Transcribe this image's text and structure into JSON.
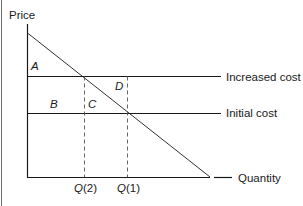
{
  "diagram": {
    "y_axis_label": "Price",
    "x_axis_label": "Quantity",
    "lines": {
      "increased_cost": "Increased cost",
      "initial_cost": "Initial cost"
    },
    "regions": {
      "a": "A",
      "b": "B",
      "c": "C",
      "d": "D"
    },
    "quantities": {
      "q2": {
        "letter": "Q",
        "index": "(2)"
      },
      "q1": {
        "letter": "Q",
        "index": "(1)"
      }
    },
    "colors": {
      "line": "#1a1a1a",
      "demand": "#333333",
      "dashed": "#555555"
    }
  }
}
